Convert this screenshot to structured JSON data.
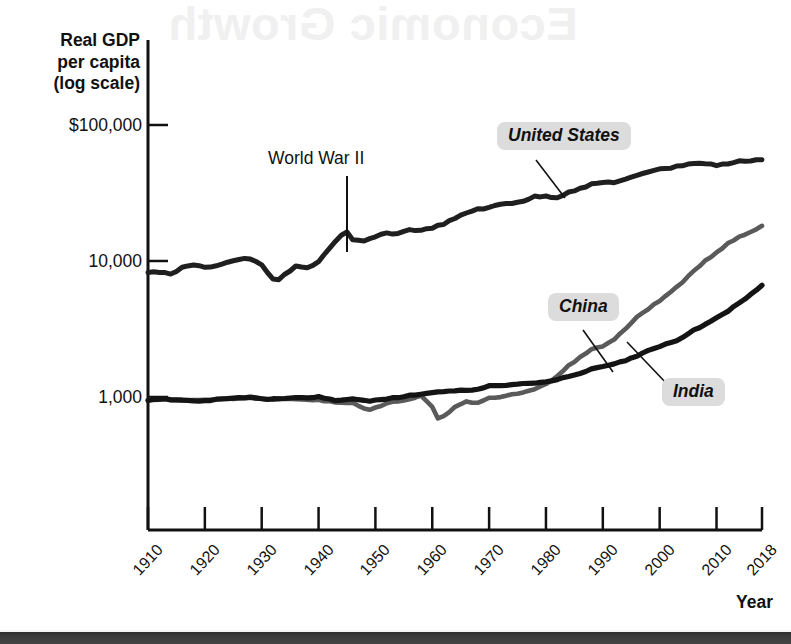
{
  "figure": {
    "y_axis_title": "Real GDP\nper capita\n(log scale)",
    "y_axis_title_lines": [
      "Real GDP",
      "per capita",
      "(log scale)"
    ],
    "x_axis_title": "Year",
    "bleed_through_text": "Economic Growth"
  },
  "annotations": {
    "world_war_ii": "World War II",
    "united_states": "United States",
    "china": "China",
    "india": "India"
  },
  "colors": {
    "united_states": "#1f1f1f",
    "india": "#141414",
    "china": "#5a5a5a",
    "axis": "#111111",
    "badge": "#dcdcdc",
    "page_edge": "#363636"
  },
  "chart_data": {
    "type": "line",
    "title": "Real GDP per capita (log scale)",
    "xlabel": "Year",
    "ylabel": "Real GDP per capita (log scale)",
    "y_scale": "log",
    "grid": false,
    "legend": "inline-labels",
    "xlim": [
      1910,
      2018
    ],
    "ylim": [
      100,
      100000
    ],
    "ytick_labels": [
      "$100,000",
      "10,000",
      "1,000"
    ],
    "ytick_values": [
      100000,
      10000,
      1000
    ],
    "xtick_labels": [
      "1910",
      "1920",
      "1930",
      "1940",
      "1950",
      "1960",
      "1970",
      "1980",
      "1990",
      "2000",
      "2010",
      "2018"
    ],
    "xtick_values": [
      1910,
      1920,
      1930,
      1940,
      1950,
      1960,
      1970,
      1980,
      1990,
      2000,
      2010,
      2018
    ],
    "annotations": [
      {
        "text": "World War II",
        "x": 1945,
        "y": 16000
      },
      {
        "text": "United States",
        "x": 1975,
        "y": 44000
      },
      {
        "text": "China",
        "x": 1988,
        "y": 3400
      },
      {
        "text": "India",
        "x": 2001,
        "y": 1750
      }
    ],
    "series": [
      {
        "name": "United States",
        "color": "#1f1f1f",
        "x": [
          1910,
          1912,
          1914,
          1916,
          1918,
          1920,
          1922,
          1924,
          1926,
          1928,
          1930,
          1932,
          1933,
          1934,
          1936,
          1938,
          1940,
          1942,
          1944,
          1945,
          1946,
          1948,
          1950,
          1952,
          1954,
          1956,
          1958,
          1960,
          1962,
          1964,
          1966,
          1968,
          1970,
          1972,
          1974,
          1976,
          1978,
          1980,
          1982,
          1984,
          1986,
          1988,
          1990,
          1992,
          1994,
          1996,
          1998,
          2000,
          2002,
          2004,
          2006,
          2008,
          2010,
          2012,
          2014,
          2016,
          2018
        ],
        "y": [
          8200,
          8300,
          8050,
          8900,
          9400,
          8900,
          9300,
          9800,
          10300,
          10400,
          9300,
          7400,
          7200,
          7900,
          9100,
          8900,
          9900,
          12600,
          15400,
          16200,
          14200,
          14000,
          15100,
          16000,
          15900,
          17100,
          16700,
          17600,
          18700,
          20500,
          22600,
          24200,
          24600,
          26200,
          26700,
          27700,
          29700,
          29900,
          29300,
          32300,
          34000,
          36500,
          37900,
          38000,
          39800,
          42300,
          45300,
          48000,
          48400,
          50600,
          52600,
          52000,
          50700,
          52000,
          54000,
          55000,
          56000
        ]
      },
      {
        "name": "China",
        "color": "#5a5a5a",
        "x": [
          1910,
          1913,
          1916,
          1919,
          1922,
          1925,
          1928,
          1931,
          1934,
          1937,
          1940,
          1943,
          1946,
          1949,
          1950,
          1952,
          1954,
          1956,
          1958,
          1959,
          1960,
          1961,
          1962,
          1963,
          1964,
          1966,
          1968,
          1970,
          1972,
          1974,
          1976,
          1978,
          1980,
          1982,
          1984,
          1986,
          1988,
          1990,
          1992,
          1994,
          1996,
          1998,
          2000,
          2002,
          2004,
          2006,
          2008,
          2010,
          2012,
          2014,
          2016,
          2018
        ],
        "y": [
          950,
          960,
          945,
          955,
          965,
          975,
          985,
          960,
          975,
          965,
          950,
          920,
          900,
          800,
          830,
          900,
          930,
          960,
          1030,
          930,
          850,
          700,
          720,
          780,
          850,
          930,
          900,
          980,
          1000,
          1040,
          1080,
          1150,
          1250,
          1420,
          1700,
          1950,
          2250,
          2350,
          2650,
          3200,
          3850,
          4450,
          5100,
          5950,
          7000,
          8400,
          10000,
          11500,
          13500,
          15000,
          16500,
          18000
        ]
      },
      {
        "name": "India",
        "color": "#141414",
        "x": [
          1910,
          1913,
          1916,
          1919,
          1922,
          1925,
          1928,
          1931,
          1934,
          1937,
          1940,
          1943,
          1946,
          1949,
          1952,
          1955,
          1958,
          1961,
          1964,
          1967,
          1970,
          1973,
          1976,
          1979,
          1982,
          1985,
          1988,
          1991,
          1994,
          1997,
          2000,
          2003,
          2006,
          2009,
          2012,
          2015,
          2018
        ],
        "y": [
          950,
          965,
          940,
          930,
          960,
          980,
          990,
          960,
          975,
          985,
          1000,
          940,
          960,
          940,
          970,
          1010,
          1050,
          1090,
          1120,
          1120,
          1200,
          1220,
          1250,
          1280,
          1350,
          1450,
          1600,
          1700,
          1850,
          2100,
          2350,
          2600,
          3100,
          3600,
          4300,
          5200,
          6600
        ]
      }
    ]
  }
}
